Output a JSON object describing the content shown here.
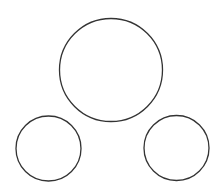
{
  "canvas": {
    "width": 223,
    "height": 194,
    "background": "#ffffff"
  },
  "stroke": {
    "color": "#333333",
    "width": 1.3
  },
  "shapes": [
    {
      "type": "circle",
      "name": "large-circle-top",
      "cx": 111,
      "cy": 70,
      "r": 51.5
    },
    {
      "type": "circle",
      "name": "small-circle-bottom-left",
      "cx": 48.5,
      "cy": 148.5,
      "r": 32.5
    },
    {
      "type": "circle",
      "name": "small-circle-bottom-right",
      "cx": 176.5,
      "cy": 148,
      "r": 32.5
    }
  ]
}
